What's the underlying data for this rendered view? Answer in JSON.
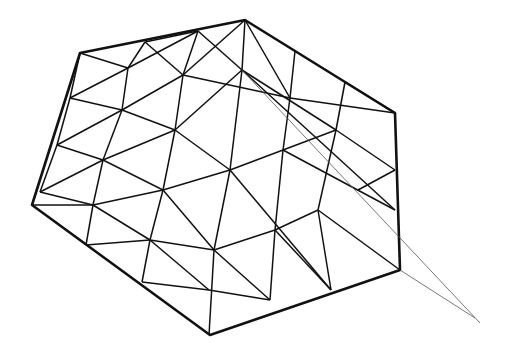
{
  "drawing": {
    "subject": "tetrahedral kite line drawing",
    "colors": {
      "background": "#ffffff",
      "ink": "#111111",
      "string": "#555555"
    },
    "outline": [
      [
        80,
        53
      ],
      [
        245,
        20
      ],
      [
        395,
        113
      ],
      [
        400,
        270
      ],
      [
        210,
        335
      ],
      [
        32,
        205
      ]
    ],
    "struts": [
      [
        [
          80,
          53
        ],
        [
          70,
          98
        ]
      ],
      [
        [
          70,
          98
        ],
        [
          57,
          145
        ]
      ],
      [
        [
          57,
          145
        ],
        [
          40,
          192
        ]
      ],
      [
        [
          145,
          42
        ],
        [
          128,
          68
        ]
      ],
      [
        [
          128,
          68
        ],
        [
          122,
          110
        ]
      ],
      [
        [
          122,
          110
        ],
        [
          103,
          160
        ]
      ],
      [
        [
          103,
          160
        ],
        [
          93,
          205
        ]
      ],
      [
        [
          93,
          205
        ],
        [
          86,
          245
        ]
      ],
      [
        [
          198,
          31
        ],
        [
          183,
          75
        ]
      ],
      [
        [
          183,
          75
        ],
        [
          175,
          130
        ]
      ],
      [
        [
          175,
          130
        ],
        [
          163,
          190
        ]
      ],
      [
        [
          163,
          190
        ],
        [
          150,
          240
        ]
      ],
      [
        [
          150,
          240
        ],
        [
          142,
          282
        ]
      ],
      [
        [
          245,
          20
        ],
        [
          242,
          70
        ]
      ],
      [
        [
          242,
          70
        ],
        [
          230,
          170
        ]
      ],
      [
        [
          230,
          170
        ],
        [
          214,
          250
        ]
      ],
      [
        [
          214,
          250
        ],
        [
          209,
          335
        ]
      ],
      [
        [
          295,
          51
        ],
        [
          290,
          98
        ]
      ],
      [
        [
          290,
          98
        ],
        [
          283,
          150
        ]
      ],
      [
        [
          283,
          150
        ],
        [
          275,
          230
        ]
      ],
      [
        [
          275,
          230
        ],
        [
          270,
          300
        ]
      ],
      [
        [
          345,
          82
        ],
        [
          336,
          130
        ]
      ],
      [
        [
          336,
          130
        ],
        [
          318,
          210
        ]
      ],
      [
        [
          318,
          210
        ],
        [
          331,
          290
        ]
      ],
      [
        [
          70,
          98
        ],
        [
          128,
          68
        ]
      ],
      [
        [
          128,
          68
        ],
        [
          198,
          31
        ]
      ],
      [
        [
          57,
          145
        ],
        [
          122,
          110
        ]
      ],
      [
        [
          122,
          110
        ],
        [
          183,
          75
        ]
      ],
      [
        [
          183,
          75
        ],
        [
          245,
          20
        ]
      ],
      [
        [
          40,
          192
        ],
        [
          103,
          160
        ]
      ],
      [
        [
          103,
          160
        ],
        [
          175,
          130
        ]
      ],
      [
        [
          175,
          130
        ],
        [
          242,
          70
        ]
      ],
      [
        [
          32,
          205
        ],
        [
          93,
          205
        ]
      ],
      [
        [
          93,
          205
        ],
        [
          163,
          190
        ]
      ],
      [
        [
          163,
          190
        ],
        [
          230,
          170
        ]
      ],
      [
        [
          230,
          170
        ],
        [
          283,
          150
        ]
      ],
      [
        [
          86,
          245
        ],
        [
          150,
          240
        ]
      ],
      [
        [
          150,
          240
        ],
        [
          214,
          250
        ]
      ],
      [
        [
          214,
          250
        ],
        [
          275,
          230
        ]
      ],
      [
        [
          275,
          230
        ],
        [
          318,
          210
        ]
      ],
      [
        [
          142,
          282
        ],
        [
          209,
          290
        ]
      ],
      [
        [
          209,
          290
        ],
        [
          270,
          300
        ]
      ],
      [
        [
          80,
          53
        ],
        [
          128,
          68
        ]
      ],
      [
        [
          145,
          42
        ],
        [
          183,
          75
        ]
      ],
      [
        [
          145,
          42
        ],
        [
          198,
          31
        ]
      ],
      [
        [
          198,
          31
        ],
        [
          242,
          70
        ]
      ],
      [
        [
          245,
          20
        ],
        [
          290,
          98
        ]
      ],
      [
        [
          242,
          70
        ],
        [
          336,
          130
        ]
      ],
      [
        [
          242,
          70
        ],
        [
          395,
          210
        ]
      ],
      [
        [
          290,
          98
        ],
        [
          395,
          113
        ]
      ],
      [
        [
          345,
          82
        ],
        [
          395,
          113
        ]
      ],
      [
        [
          57,
          145
        ],
        [
          103,
          160
        ]
      ],
      [
        [
          122,
          110
        ],
        [
          175,
          130
        ]
      ],
      [
        [
          183,
          75
        ],
        [
          290,
          98
        ]
      ],
      [
        [
          70,
          98
        ],
        [
          122,
          110
        ]
      ],
      [
        [
          40,
          192
        ],
        [
          93,
          205
        ]
      ],
      [
        [
          103,
          160
        ],
        [
          163,
          190
        ]
      ],
      [
        [
          175,
          130
        ],
        [
          230,
          170
        ]
      ],
      [
        [
          230,
          170
        ],
        [
          331,
          290
        ]
      ],
      [
        [
          283,
          150
        ],
        [
          395,
          210
        ]
      ],
      [
        [
          336,
          130
        ],
        [
          395,
          170
        ]
      ],
      [
        [
          318,
          210
        ],
        [
          400,
          270
        ]
      ],
      [
        [
          163,
          190
        ],
        [
          214,
          250
        ]
      ],
      [
        [
          93,
          205
        ],
        [
          150,
          240
        ]
      ],
      [
        [
          150,
          240
        ],
        [
          209,
          290
        ]
      ],
      [
        [
          214,
          250
        ],
        [
          270,
          300
        ]
      ],
      [
        [
          275,
          230
        ],
        [
          331,
          290
        ]
      ],
      [
        [
          336,
          130
        ],
        [
          283,
          150
        ]
      ],
      [
        [
          395,
          170
        ],
        [
          358,
          190
        ]
      ]
    ],
    "strings": [
      [
        [
          400,
          270
        ],
        [
          475,
          318
        ]
      ],
      [
        [
          242,
          70
        ],
        [
          480,
          323
        ]
      ]
    ]
  }
}
